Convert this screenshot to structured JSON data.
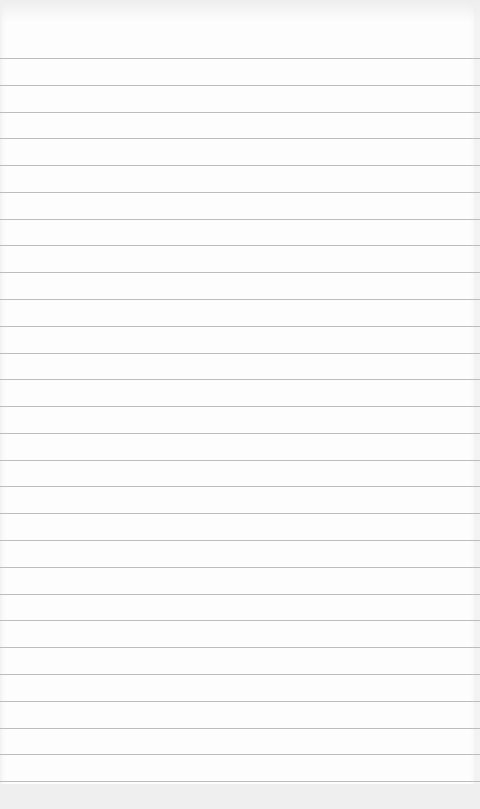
{
  "page": {
    "type": "lined-notepad-paper",
    "content_text": "",
    "colors": {
      "paper": "#fdfdfd",
      "rule_line": "#bdbdbd",
      "edge": "#efefef"
    },
    "rules": {
      "count": 28,
      "first_y": 58,
      "spacing": 26.78
    }
  }
}
